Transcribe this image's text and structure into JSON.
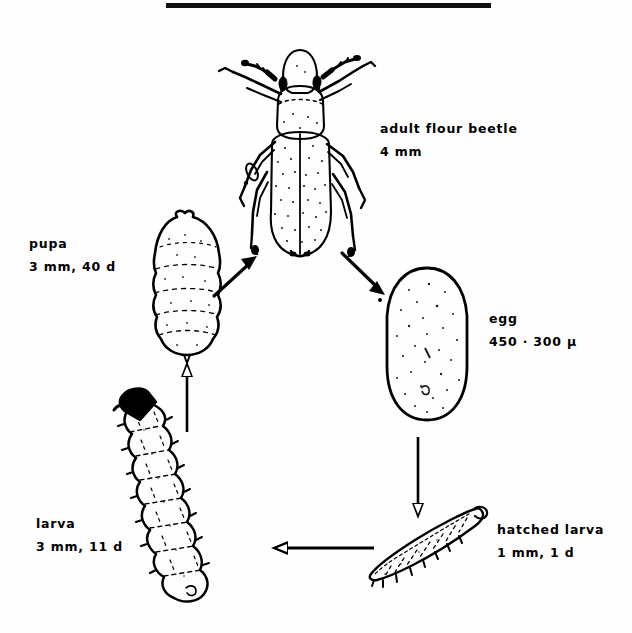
{
  "figure": {
    "background_color": "#fefefe",
    "ink_color": "#000000",
    "top_rule": {
      "name": "black-rule",
      "x": 166,
      "y": 3,
      "width": 325,
      "height": 5
    }
  },
  "stages": [
    {
      "id": "adult",
      "name": "adult-flour-beetle",
      "label_line1": "adult  flour  beetle",
      "label_line2": "4 mm",
      "label_x": 380,
      "label_y": 117
    },
    {
      "id": "pupa",
      "name": "pupa",
      "label_line1": "pupa",
      "label_line2": "3 mm, 40 d",
      "label_x": 29,
      "label_y": 232
    },
    {
      "id": "egg",
      "name": "egg",
      "label_line1": "egg",
      "label_line2": "450 · 300 μ",
      "label_x": 489,
      "label_y": 307
    },
    {
      "id": "larva",
      "name": "larva",
      "label_line1": "larva",
      "label_line2": "3 mm, 11 d",
      "label_x": 36,
      "label_y": 512
    },
    {
      "id": "hatched-larva",
      "name": "hatched-larva",
      "label_line1": "hatched larva",
      "label_line2": "1 mm, 1 d",
      "label_x": 497,
      "label_y": 518
    }
  ],
  "arrows": [
    {
      "id": "pupa-to-adult",
      "name": "arrow-pupa-to-adult",
      "from": "pupa",
      "to": "adult",
      "direction": "up-right"
    },
    {
      "id": "adult-to-egg",
      "name": "arrow-adult-to-egg",
      "from": "adult",
      "to": "egg",
      "direction": "down-right"
    },
    {
      "id": "egg-to-hatched",
      "name": "arrow-egg-to-hatched",
      "from": "egg",
      "to": "hatched-larva",
      "direction": "down"
    },
    {
      "id": "hatched-to-larva",
      "name": "arrow-hatched-to-larva",
      "from": "hatched-larva",
      "to": "larva",
      "direction": "left"
    },
    {
      "id": "larva-to-pupa",
      "name": "arrow-larva-to-pupa",
      "from": "larva",
      "to": "pupa",
      "direction": "up"
    }
  ]
}
